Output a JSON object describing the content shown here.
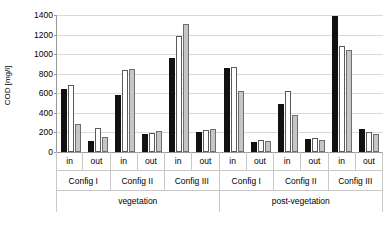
{
  "chart_data": {
    "type": "bar",
    "title": "",
    "xlabel": "",
    "ylabel": "COD [mg/l]",
    "ylim": [
      0,
      1400
    ],
    "ytick_step": 200,
    "yticks": [
      "1400",
      "1200",
      "1000",
      "800",
      "600",
      "400",
      "200",
      "0"
    ],
    "grid": true,
    "legend": "none",
    "series": [
      {
        "name": "series-1",
        "color": "#111111",
        "values": [
          640,
          110,
          580,
          180,
          960,
          200,
          855,
          100,
          490,
          130,
          1390,
          240
        ]
      },
      {
        "name": "series-2",
        "color": "#ffffff",
        "values": [
          680,
          250,
          840,
          195,
          1190,
          230,
          870,
          120,
          620,
          140,
          1085,
          205
        ]
      },
      {
        "name": "series-3",
        "color": "#c6c6c6",
        "values": [
          290,
          155,
          845,
          215,
          1310,
          240,
          620,
          115,
          380,
          120,
          1045,
          185
        ]
      }
    ],
    "categories": [
      "vegetation / Config I / in",
      "vegetation / Config I / out",
      "vegetation / Config II / in",
      "vegetation / Config II / out",
      "vegetation / Config III / in",
      "vegetation / Config III / out",
      "post-vegetation / Config I / in",
      "post-vegetation / Config I / out",
      "post-vegetation / Config II / in",
      "post-vegetation / Config II / out",
      "post-vegetation / Config III / in",
      "post-vegetation / Config III / out"
    ]
  },
  "axis": {
    "y_label": "COD [mg/l]",
    "ticks": [
      {
        "label": "1400",
        "value": 1400
      },
      {
        "label": "1200",
        "value": 1200
      },
      {
        "label": "1000",
        "value": 1000
      },
      {
        "label": "800",
        "value": 800
      },
      {
        "label": "600",
        "value": 600
      },
      {
        "label": "400",
        "value": 400
      },
      {
        "label": "200",
        "value": 200
      },
      {
        "label": "0",
        "value": 0
      }
    ]
  },
  "xaxis": {
    "flow_labels": [
      "in",
      "out",
      "in",
      "out",
      "in",
      "out",
      "in",
      "out",
      "in",
      "out",
      "in",
      "out"
    ],
    "config_labels": [
      "Config I",
      "Config II",
      "Config III",
      "Config I",
      "Config II",
      "Config III"
    ],
    "phase_labels": [
      "vegetation",
      "post-vegetation"
    ]
  }
}
